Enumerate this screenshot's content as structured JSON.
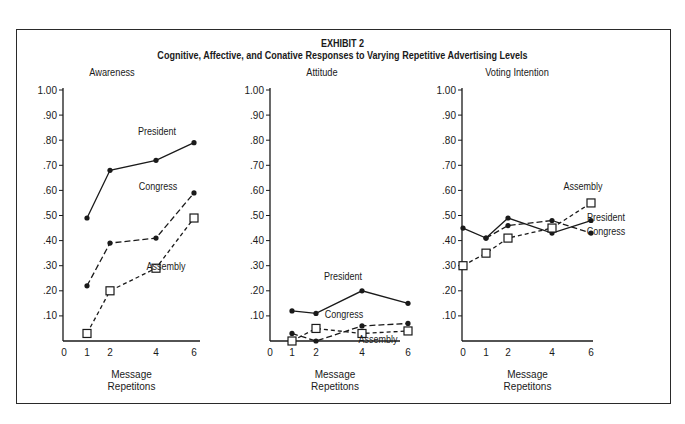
{
  "exhibit": {
    "label": "EXHIBIT  2",
    "title": "Cognitive, Affective, and Conative Responses to Varying Repetitive Advertising Levels"
  },
  "chart_data": [
    {
      "type": "line",
      "title": "Awareness",
      "xlabel": "Message Repetitons",
      "ylabel": "",
      "x_ticks": [
        0,
        1,
        2,
        4,
        6
      ],
      "y_ticks": [
        ".10",
        ".20",
        ".30",
        ".40",
        ".50",
        ".60",
        ".70",
        ".80",
        ".90",
        "1.00"
      ],
      "ylim": [
        0,
        1.0
      ],
      "series": [
        {
          "name": "President",
          "style": "solid",
          "marker": "dot",
          "x": [
            1,
            2,
            4,
            6
          ],
          "values": [
            0.49,
            0.68,
            0.72,
            0.79
          ]
        },
        {
          "name": "Congress",
          "style": "dashed",
          "marker": "dot",
          "x": [
            1,
            2,
            4,
            6
          ],
          "values": [
            0.22,
            0.39,
            0.41,
            0.59
          ]
        },
        {
          "name": "Assembly",
          "style": "dotted-dash",
          "marker": "square",
          "x": [
            1,
            2,
            4,
            6
          ],
          "values": [
            0.03,
            0.2,
            0.29,
            0.49
          ]
        }
      ]
    },
    {
      "type": "line",
      "title": "Attitude",
      "xlabel": "Message Repetitons",
      "ylabel": "",
      "x_ticks": [
        0,
        1,
        2,
        4,
        6
      ],
      "y_ticks": [
        ".10",
        ".20",
        ".30",
        ".40",
        ".50",
        ".60",
        ".70",
        ".80",
        ".90",
        "1.00"
      ],
      "ylim": [
        0,
        1.0
      ],
      "series": [
        {
          "name": "President",
          "style": "solid",
          "marker": "dot",
          "x": [
            1,
            2,
            4,
            6
          ],
          "values": [
            0.12,
            0.11,
            0.2,
            0.15
          ]
        },
        {
          "name": "Congress",
          "style": "dashed",
          "marker": "dot",
          "x": [
            1,
            2,
            4,
            6
          ],
          "values": [
            0.03,
            0.0,
            0.06,
            0.07
          ]
        },
        {
          "name": "Assembly",
          "style": "dotted-dash",
          "marker": "square",
          "x": [
            1,
            2,
            4,
            6
          ],
          "values": [
            0.0,
            0.05,
            0.03,
            0.04
          ]
        }
      ]
    },
    {
      "type": "line",
      "title": "Voting Intention",
      "xlabel": "Message Repetitons",
      "ylabel": "",
      "x_ticks": [
        0,
        1,
        2,
        4,
        6
      ],
      "y_ticks": [
        ".10",
        ".20",
        ".30",
        ".40",
        ".50",
        ".60",
        ".70",
        ".80",
        ".90",
        "1.00"
      ],
      "ylim": [
        0,
        1.0
      ],
      "series": [
        {
          "name": "President",
          "style": "solid",
          "marker": "dot",
          "x": [
            0,
            1,
            2,
            4,
            6
          ],
          "values": [
            0.45,
            0.41,
            0.49,
            0.43,
            0.48
          ]
        },
        {
          "name": "Congress",
          "style": "dashed",
          "marker": "dot",
          "x": [
            1,
            2,
            4,
            6
          ],
          "values": [
            0.41,
            0.46,
            0.48,
            0.43
          ]
        },
        {
          "name": "Assembly",
          "style": "dotted-dash",
          "marker": "square",
          "x": [
            0,
            1,
            2,
            4,
            6
          ],
          "values": [
            0.3,
            0.35,
            0.41,
            0.45,
            0.55
          ]
        }
      ]
    }
  ],
  "layout": {
    "panels": [
      {
        "axis_x": 63,
        "x_pos": {
          "0": 64,
          "1": 87,
          "2": 110,
          "4": 156,
          "6": 194
        },
        "x_end": 200,
        "title_x": 112,
        "labels": [
          {
            "text": "President",
            "x": 157,
            "y": 135
          },
          {
            "text": "Congress",
            "x": 158,
            "y": 190
          },
          {
            "text": "Assembly",
            "x": 166,
            "y": 270
          }
        ]
      },
      {
        "axis_x": 270,
        "x_pos": {
          "0": 270,
          "1": 292,
          "2": 316,
          "4": 362,
          "6": 408
        },
        "x_end": 400,
        "title_x": 322,
        "labels": [
          {
            "text": "President",
            "x": 343,
            "y": 280
          },
          {
            "text": "Congress",
            "x": 344,
            "y": 318
          },
          {
            "text": "Assembly",
            "x": 378,
            "y": 343
          }
        ]
      },
      {
        "axis_x": 462,
        "x_pos": {
          "0": 463,
          "1": 486,
          "2": 508,
          "4": 552,
          "6": 591
        },
        "x_end": 593,
        "title_x": 517,
        "labels": [
          {
            "text": "Assembly",
            "x": 583,
            "y": 190
          },
          {
            "text": "President",
            "x": 606,
            "y": 221
          },
          {
            "text": "Congress",
            "x": 606,
            "y": 235
          }
        ]
      }
    ],
    "baseline_y": 341,
    "top_y": 90,
    "ink": "#1a1a1a"
  }
}
